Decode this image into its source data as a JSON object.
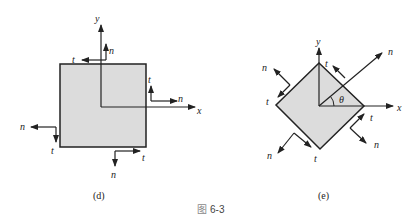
{
  "figure": {
    "caption_glyph": "图",
    "caption_number": "6-3",
    "colors": {
      "fill": "#dcdcdc",
      "stroke": "#222222",
      "caption_box": "#8a8a8a"
    }
  },
  "panel_d": {
    "label": "(d)",
    "axes": {
      "x": "x",
      "y": "y"
    },
    "faces": {
      "top": {
        "n": "n",
        "t": "t"
      },
      "right": {
        "n": "n",
        "t": "t"
      },
      "left": {
        "n": "n",
        "t": "t"
      },
      "bottom": {
        "n": "n",
        "t": "t"
      }
    }
  },
  "panel_e": {
    "label": "(e)",
    "axes": {
      "x": "x",
      "y": "y"
    },
    "angle": "θ",
    "rotated_axis": "n",
    "faces": {
      "upper_right": {
        "t": "t"
      },
      "upper_left": {
        "n": "n",
        "t": "t"
      },
      "lower_right": {
        "n": "n",
        "t": "t"
      },
      "lower_left": {
        "n": "n",
        "t": "t"
      }
    }
  }
}
